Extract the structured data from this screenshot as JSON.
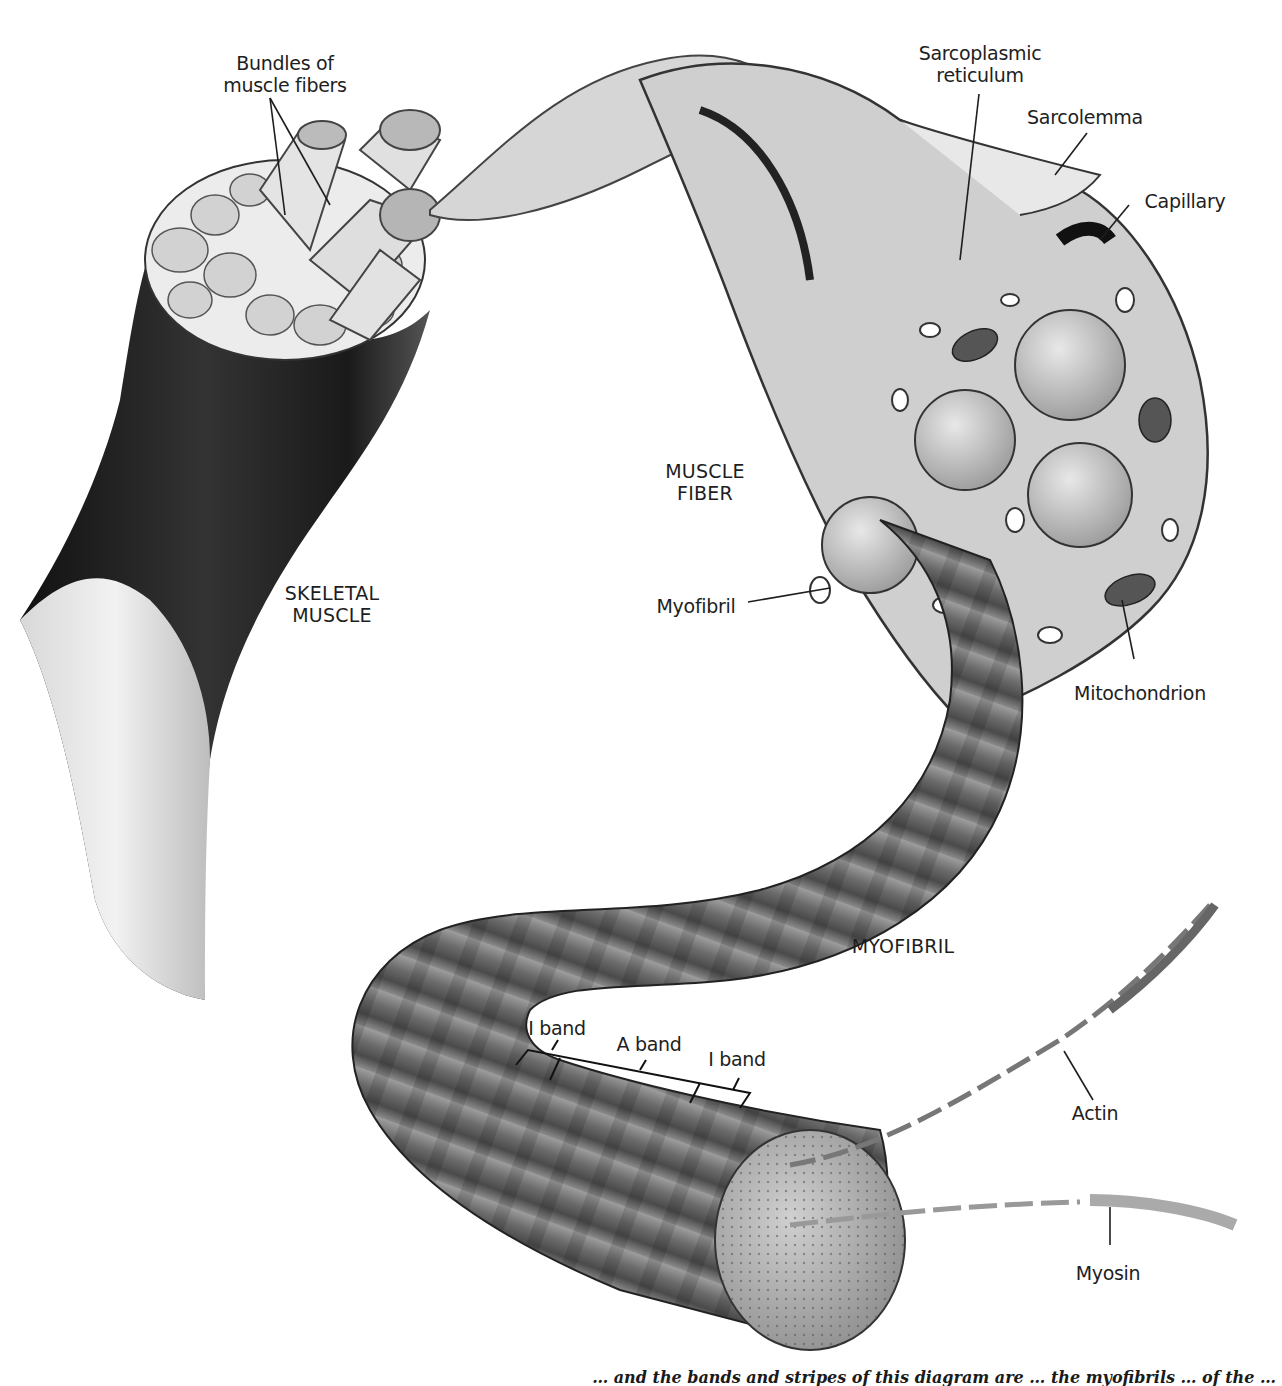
{
  "figure": {
    "labels": {
      "bundles": "Bundles of\nmuscle fibers",
      "bundles_line1": "Bundles of",
      "bundles_line2": "muscle fibers",
      "sr_line1": "Sarcoplasmic",
      "sr_line2": "reticulum",
      "sarcolemma": "Sarcolemma",
      "capillary": "Capillary",
      "muscle_fiber_line1": "MUSCLE",
      "muscle_fiber_line2": "FIBER",
      "skeletal_line1": "SKELETAL",
      "skeletal_line2": "MUSCLE",
      "myofibril_small": "Myofibril",
      "mitochondrion": "Mitochondrion",
      "myofibril_caps": "MYOFIBRIL",
      "i_band_left": "I band",
      "a_band": "A band",
      "i_band_right": "I band",
      "actin": "Actin",
      "myosin": "Myosin"
    },
    "caption_fragment": "… and the bands and stripes of this diagram are … the myofibrils … of the …",
    "colors": {
      "ink": "#1e1e1e",
      "tissue_light": "#e6e6e6",
      "tissue_mid": "#9a9a9a",
      "tissue_dark": "#2a2a2a",
      "background": "#ffffff"
    }
  }
}
